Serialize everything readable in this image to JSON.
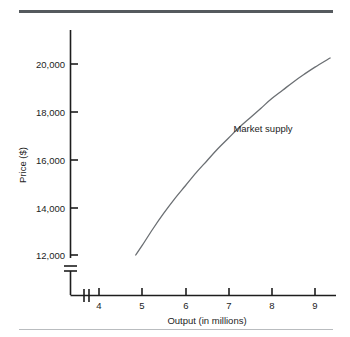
{
  "figure": {
    "background": "#ffffff",
    "rule_top_color": "#555a5e",
    "rule_bottom_color": "#b9bcbf",
    "axis_color": "#1d1d1d",
    "curve_color": "#6b6f73"
  },
  "chart_data": {
    "type": "line",
    "title": "",
    "xlabel": "Output (in millions)",
    "ylabel": "Price ($)",
    "xlim": [
      3.4,
      9.6
    ],
    "ylim": [
      11000,
      21000
    ],
    "grid": false,
    "legend_position": "inline-annotation",
    "x_ticks": [
      4,
      5,
      6,
      7,
      8,
      9
    ],
    "x_tick_labels": [
      "4",
      "5",
      "6",
      "7",
      "8",
      "9"
    ],
    "y_ticks": [
      12000,
      14000,
      16000,
      18000,
      20000
    ],
    "y_tick_labels": [
      "12,000",
      "14,000",
      "16,000",
      "18,000",
      "20,000"
    ],
    "axis_break_x": true,
    "axis_break_y": true,
    "series": [
      {
        "name": "Market supply",
        "color": "#6b6f73",
        "x": [
          4.85,
          5.0,
          5.25,
          5.5,
          5.75,
          6.0,
          6.25,
          6.5,
          6.75,
          7.0,
          7.25,
          7.5,
          7.75,
          8.0,
          8.25,
          8.5,
          8.75,
          9.0,
          9.35
        ],
        "values": [
          12000,
          12400,
          13100,
          13750,
          14350,
          14900,
          15450,
          15950,
          16450,
          16900,
          17350,
          17750,
          18150,
          18550,
          18900,
          19250,
          19570,
          19870,
          20250
        ]
      }
    ],
    "annotations": [
      {
        "text": "Market supply",
        "x": 7.45,
        "y": 17900
      }
    ]
  }
}
